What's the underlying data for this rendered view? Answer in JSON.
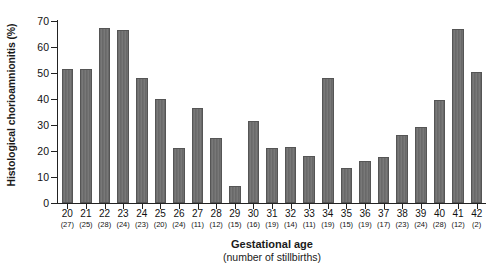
{
  "chart_data": {
    "type": "bar",
    "title": "",
    "xlabel": "Gestational age",
    "xlabel_sub": "(number of stillbirths)",
    "ylabel": "Histological chorioamnionitis (%)",
    "ylim": [
      0,
      70
    ],
    "ytick_labels": [
      "0",
      "10",
      "20",
      "30",
      "40",
      "50",
      "60",
      "70"
    ],
    "yticks": [
      0,
      10,
      20,
      30,
      40,
      50,
      60,
      70
    ],
    "grid": false,
    "legend": null,
    "bar_color": "#6f6f6f",
    "bar_edge_color": "#555555",
    "categories": [
      "20",
      "21",
      "22",
      "23",
      "24",
      "25",
      "26",
      "27",
      "28",
      "29",
      "30",
      "31",
      "32",
      "33",
      "34",
      "35",
      "36",
      "37",
      "38",
      "39",
      "40",
      "41",
      "42"
    ],
    "counts": [
      27,
      25,
      28,
      24,
      23,
      20,
      24,
      11,
      12,
      15,
      16,
      19,
      14,
      11,
      19,
      15,
      19,
      17,
      23,
      24,
      28,
      12,
      2
    ],
    "count_labels": [
      "(27)",
      "(25)",
      "(28)",
      "(24)",
      "(23)",
      "(20)",
      "(24)",
      "(11)",
      "(12)",
      "(15)",
      "(16)",
      "(19)",
      "(14)",
      "(11)",
      "(19)",
      "(15)",
      "(19)",
      "(17)",
      "(23)",
      "(24)",
      "(28)",
      "(12)",
      "(2)"
    ],
    "values": [
      51.5,
      51.5,
      67.5,
      66.5,
      48.0,
      40.0,
      21.0,
      36.5,
      25.0,
      6.7,
      31.5,
      21.3,
      21.7,
      18.2,
      48.0,
      13.4,
      16.0,
      17.8,
      26.2,
      29.3,
      39.5,
      67.0,
      50.5
    ],
    "series": [
      {
        "name": "Histological chorioamnionitis (%)",
        "values": [
          51.5,
          51.5,
          67.5,
          66.5,
          48.0,
          40.0,
          21.0,
          36.5,
          25.0,
          6.7,
          31.5,
          21.3,
          21.7,
          18.2,
          48.0,
          13.4,
          16.0,
          17.8,
          26.2,
          29.3,
          39.5,
          67.0,
          50.5
        ]
      }
    ]
  }
}
